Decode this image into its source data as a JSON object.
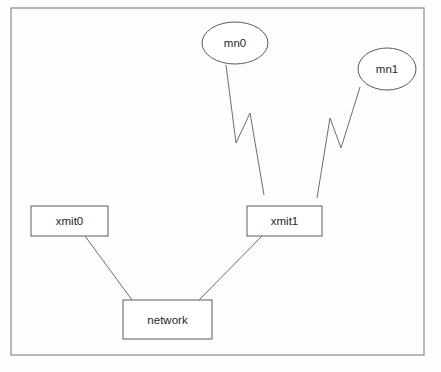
{
  "diagram": {
    "background_color": "#fdfdfd",
    "frame": {
      "name": "diagram-frame",
      "x": 11,
      "y": 8,
      "width": 413,
      "height": 347,
      "stroke": "#9a9a9a"
    },
    "node_stroke_color": "#5a5a5a",
    "edge_stroke_color": "#6e6e6e",
    "label_color": "#262626",
    "nodes": [
      {
        "id": "mn0",
        "label": "mn0",
        "shape": "ellipse",
        "cx": 235,
        "cy": 43,
        "rx": 33,
        "ry": 21
      },
      {
        "id": "mn1",
        "label": "mn1",
        "shape": "ellipse",
        "cx": 387,
        "cy": 69,
        "rx": 29,
        "ry": 21
      },
      {
        "id": "xmit0",
        "label": "xmit0",
        "shape": "rect",
        "x": 31,
        "y": 206,
        "width": 77,
        "height": 30
      },
      {
        "id": "xmit1",
        "label": "xmit1",
        "shape": "rect",
        "x": 247,
        "y": 206,
        "width": 75,
        "height": 30
      },
      {
        "id": "network",
        "label": "network",
        "shape": "rect",
        "x": 123,
        "y": 300,
        "width": 89,
        "height": 39
      }
    ],
    "edges": [
      {
        "id": "xmit0-network",
        "from": "xmit0",
        "to": "network",
        "kind": "wired",
        "points": "85,236 132,300"
      },
      {
        "id": "xmit1-network",
        "from": "xmit1",
        "to": "network",
        "kind": "wired",
        "points": "262,236 199,300"
      },
      {
        "id": "mn0-xmit1",
        "from": "mn0",
        "to": "xmit1",
        "kind": "wireless",
        "points": "226,65 236,143 250,113 264,195"
      },
      {
        "id": "mn1-xmit1",
        "from": "mn1",
        "to": "xmit1",
        "kind": "wireless",
        "points": "360,87 341,148 330,118 317,198"
      }
    ]
  }
}
